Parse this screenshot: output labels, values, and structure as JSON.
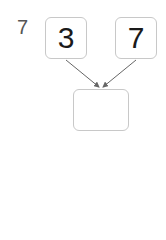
{
  "problem": {
    "number": "7",
    "left_value": "3",
    "right_value": "7",
    "answer_value": ""
  },
  "colors": {
    "box_border": "#c8c8c8",
    "arrow": "#666666",
    "text": "#1a1a1a"
  }
}
